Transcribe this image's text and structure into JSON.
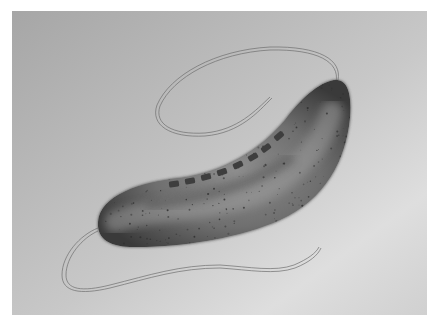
{
  "image": {
    "subject": "bacterium-illustration",
    "description": "Grayscale illustration of a curved rod-shaped bacterium with flagella at both poles",
    "colors": {
      "background_dark": "#a9a9a9",
      "background_light": "#e2e2e2",
      "frame": "#ffffff",
      "cell_edge": "#3a3a3a",
      "cell_mid": "#7a7a7a",
      "cell_highlight": "#9a9a9a",
      "granule": "#2e2e2e",
      "flagellum": "#6e6e6e"
    },
    "features": {
      "cell_body_count": 1,
      "inner_segment_count": 8,
      "flagella_count": 2
    }
  }
}
